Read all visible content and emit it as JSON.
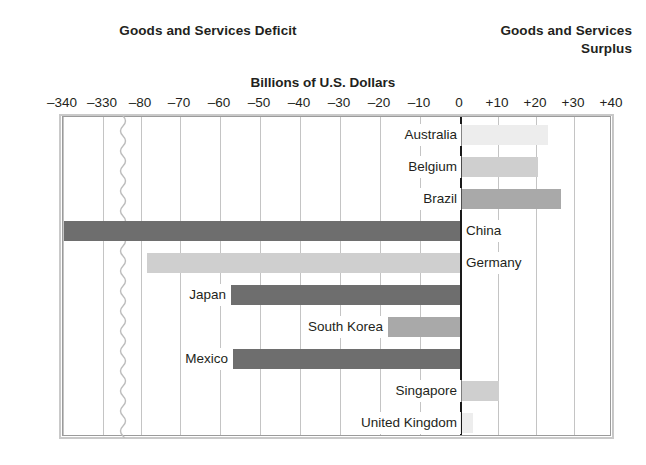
{
  "headers": {
    "deficit_title": "Goods and Services Deficit",
    "surplus_title_line1": "Goods and Services",
    "surplus_title_line2": "Surplus"
  },
  "axis_title": "Billions of U.S. Dollars",
  "ticks": [
    {
      "label": "–340",
      "value": -340,
      "x": 62
    },
    {
      "label": "–330",
      "value": -330,
      "x": 102
    },
    {
      "label": "–80",
      "value": -80,
      "x": 140
    },
    {
      "label": "–70",
      "value": -70,
      "x": 179
    },
    {
      "label": "–60",
      "value": -60,
      "x": 219
    },
    {
      "label": "–50",
      "value": -50,
      "x": 259
    },
    {
      "label": "–40",
      "value": -40,
      "x": 299
    },
    {
      "label": "–30",
      "value": -30,
      "x": 339
    },
    {
      "label": "–20",
      "value": -20,
      "x": 379
    },
    {
      "label": "–10",
      "value": -10,
      "x": 419
    },
    {
      "label": "0",
      "value": 0,
      "x": 459
    },
    {
      "label": "+10",
      "value": 10,
      "x": 497
    },
    {
      "label": "+20",
      "value": 20,
      "x": 535
    },
    {
      "label": "+30",
      "value": 30,
      "x": 573
    },
    {
      "label": "+40",
      "value": 40,
      "x": 611
    }
  ],
  "colors": {
    "bar_dark": "#6e6e6e",
    "bar_mid": "#a9a9a9",
    "bar_light": "#cfcfcf",
    "bar_very_light": "#ededed",
    "gridline": "#c4c4c4",
    "zeroline": "#1a1a1a",
    "frame": "#9b9b9b",
    "text": "#231f20",
    "background": "#ffffff"
  },
  "axis_break": {
    "present": true,
    "between_labels": [
      "–330",
      "–80"
    ],
    "x": 122
  },
  "chart_data": {
    "type": "bar",
    "orientation": "horizontal",
    "title": "",
    "subtitle": "",
    "xlabel": "Billions of U.S. Dollars",
    "ylabel": "",
    "xlim": [
      -340,
      40
    ],
    "axis_break": true,
    "grid": true,
    "legend": null,
    "annotations": [
      "Goods and Services Deficit",
      "Goods and Services Surplus"
    ],
    "xtick_labels": [
      "–340",
      "–330",
      "–80",
      "–70",
      "–60",
      "–50",
      "–40",
      "–30",
      "–20",
      "–10",
      "0",
      "+10",
      "+20",
      "+30",
      "+40"
    ],
    "categories": [
      "Australia",
      "Belgium",
      "Brazil",
      "China",
      "Germany",
      "Japan",
      "South Korea",
      "Mexico",
      "Singapore",
      "United Kingdom"
    ],
    "values": [
      22,
      20,
      26,
      -335,
      -80,
      -60,
      -18,
      -58,
      10,
      3
    ],
    "series": [
      {
        "name": "Goods and Services Balance",
        "values": [
          22,
          20,
          26,
          -335,
          -80,
          -60,
          -18,
          -58,
          10,
          3
        ]
      }
    ]
  },
  "rows": [
    {
      "label": "Australia",
      "value": 22,
      "y": 2,
      "bar_left": 461,
      "bar_width": 86,
      "shade": "bar_very_light",
      "label_side": "left"
    },
    {
      "label": "Belgium",
      "value": 20,
      "y": 34,
      "bar_left": 461,
      "bar_width": 76,
      "shade": "bar_light",
      "label_side": "left"
    },
    {
      "label": "Brazil",
      "value": 26,
      "y": 66,
      "bar_left": 461,
      "bar_width": 99,
      "shade": "bar_mid",
      "label_side": "left"
    },
    {
      "label": "China",
      "value": -335,
      "y": 98,
      "bar_left": 63,
      "bar_width": 396,
      "shade": "bar_dark",
      "label_side": "right"
    },
    {
      "label": "Germany",
      "value": -80,
      "y": 130,
      "bar_left": 146,
      "bar_width": 313,
      "shade": "bar_light",
      "label_side": "right"
    },
    {
      "label": "Japan",
      "value": -60,
      "y": 162,
      "bar_left": 230,
      "bar_width": 229,
      "shade": "bar_dark",
      "label_side": "left"
    },
    {
      "label": "South Korea",
      "value": -18,
      "y": 194,
      "bar_left": 387,
      "bar_width": 72,
      "shade": "bar_mid",
      "label_side": "left"
    },
    {
      "label": "Mexico",
      "value": -58,
      "y": 226,
      "bar_left": 232,
      "bar_width": 227,
      "shade": "bar_dark",
      "label_side": "left"
    },
    {
      "label": "Singapore",
      "value": 10,
      "y": 258,
      "bar_left": 461,
      "bar_width": 37,
      "shade": "bar_light",
      "label_side": "left"
    },
    {
      "label": "United Kingdom",
      "value": 3,
      "y": 290,
      "bar_left": 461,
      "bar_width": 11,
      "shade": "bar_very_light",
      "label_side": "left"
    }
  ]
}
